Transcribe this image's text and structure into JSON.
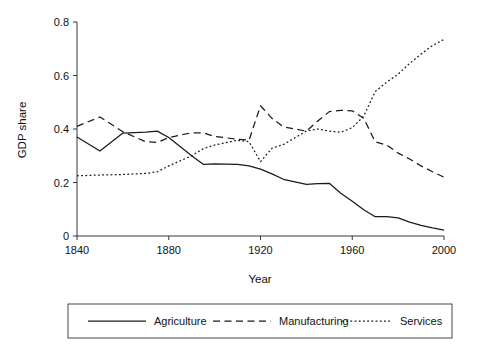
{
  "chart_data": {
    "type": "line",
    "title": "",
    "xlabel": "Year",
    "ylabel": "GDP share",
    "xlim": [
      1840,
      2000
    ],
    "ylim": [
      0,
      0.8
    ],
    "grid": false,
    "legend_position": "bottom",
    "xticks": [
      "1840",
      "1880",
      "1920",
      "1960",
      "2000"
    ],
    "xtick_values": [
      1840,
      1880,
      1920,
      1960,
      2000
    ],
    "yticks": [
      "0",
      "0.2",
      "0.4",
      "0.6",
      "0.8"
    ],
    "ytick_values": [
      0,
      0.2,
      0.4,
      0.6,
      0.8
    ],
    "x": [
      1840,
      1850,
      1860,
      1870,
      1875,
      1880,
      1890,
      1895,
      1900,
      1910,
      1915,
      1920,
      1925,
      1930,
      1940,
      1945,
      1950,
      1955,
      1960,
      1965,
      1970,
      1975,
      1980,
      1985,
      1990,
      1995,
      2000
    ],
    "series": [
      {
        "name": "Agriculture",
        "style": "solid",
        "values": [
          0.37,
          0.318,
          0.385,
          0.388,
          0.392,
          0.368,
          0.3,
          0.268,
          0.27,
          0.268,
          0.262,
          0.25,
          0.232,
          0.212,
          0.193,
          0.196,
          0.197,
          0.16,
          0.13,
          0.098,
          0.072,
          0.072,
          0.068,
          0.052,
          0.04,
          0.03,
          0.022
        ]
      },
      {
        "name": "Manufacturing",
        "style": "dashed",
        "values": [
          0.41,
          0.445,
          0.39,
          0.352,
          0.35,
          0.368,
          0.386,
          0.386,
          0.372,
          0.362,
          0.358,
          0.487,
          0.44,
          0.408,
          0.392,
          0.43,
          0.465,
          0.47,
          0.468,
          0.44,
          0.352,
          0.34,
          0.31,
          0.288,
          0.262,
          0.24,
          0.22
        ]
      },
      {
        "name": "Services",
        "style": "dotted",
        "values": [
          0.225,
          0.228,
          0.23,
          0.234,
          0.24,
          0.262,
          0.3,
          0.326,
          0.34,
          0.358,
          0.352,
          0.278,
          0.328,
          0.342,
          0.392,
          0.4,
          0.392,
          0.388,
          0.405,
          0.448,
          0.54,
          0.575,
          0.605,
          0.645,
          0.68,
          0.712,
          0.735
        ]
      }
    ]
  },
  "legend": {
    "items": [
      {
        "label": "Agriculture",
        "style": "solid"
      },
      {
        "label": "Manufacturing",
        "style": "dashed"
      },
      {
        "label": "Services",
        "style": "dotted"
      }
    ]
  },
  "colors": {
    "line": "#1a1a1a",
    "axis": "#222222",
    "background": "#ffffff"
  }
}
